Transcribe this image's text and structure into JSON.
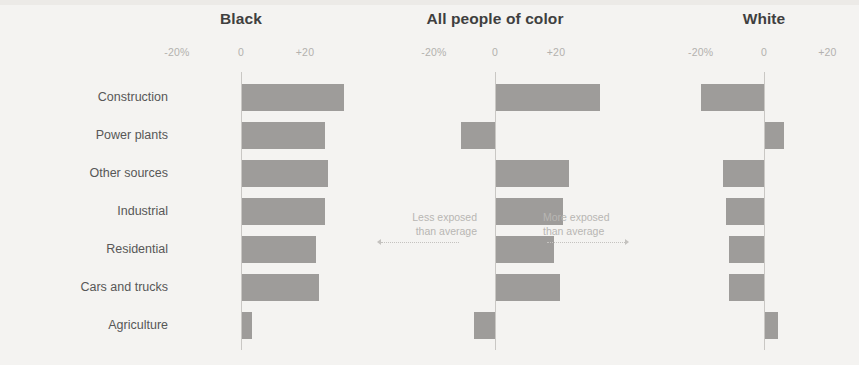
{
  "chart_data": {
    "type": "bar",
    "title": "",
    "subtitle": "",
    "xlabel": "",
    "ylabel": "",
    "orientation": "horizontal",
    "grid": false,
    "legend_position": "none",
    "xlim": [
      -20,
      20
    ],
    "categories": [
      "Construction",
      "Power plants",
      "Other sources",
      "Industrial",
      "Residential",
      "Cars and trucks",
      "Agriculture"
    ],
    "panels": [
      {
        "title": "Black",
        "tick_labels": [
          "-20%",
          "0",
          "+20"
        ],
        "tick_values": [
          -20,
          0,
          20
        ],
        "values": [
          32,
          26,
          27,
          26,
          23,
          24,
          3
        ]
      },
      {
        "title": "All people of color",
        "tick_labels": [
          "-20%",
          "0",
          "+20"
        ],
        "tick_values": [
          -20,
          0,
          20
        ],
        "values": [
          34,
          -11,
          24,
          22,
          19,
          21,
          -7
        ]
      },
      {
        "title": "White",
        "tick_labels": [
          "-20%",
          "0",
          "+20"
        ],
        "tick_values": [
          -20,
          0,
          20
        ],
        "values": [
          -20,
          6,
          -13,
          -12,
          -11,
          -11,
          4
        ]
      }
    ],
    "annotations": [
      {
        "line1": "Less exposed",
        "line2": "than average",
        "direction": "left"
      },
      {
        "line1": "More exposed",
        "line2": "than average",
        "direction": "right"
      }
    ],
    "colors": {
      "bar": "#9e9c9a",
      "zero_line": "#c9c7c4",
      "tick_text": "#b3b1ae",
      "category_text": "#575757",
      "title_text": "#3f3f3f",
      "annotation_text": "#b8b6b3",
      "background": "#f4f3f1"
    }
  }
}
